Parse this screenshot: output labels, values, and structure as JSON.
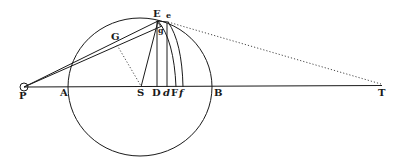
{
  "figure": {
    "labels": {
      "P": "P",
      "A": "A",
      "G": "G",
      "S": "S",
      "D": "D",
      "d": "d",
      "F": "F",
      "f": "f",
      "B": "B",
      "T": "T",
      "E": "E",
      "e": "e",
      "g": "g"
    },
    "colors": {
      "ink": "#1a1a1a",
      "background": "#ffffff"
    }
  }
}
